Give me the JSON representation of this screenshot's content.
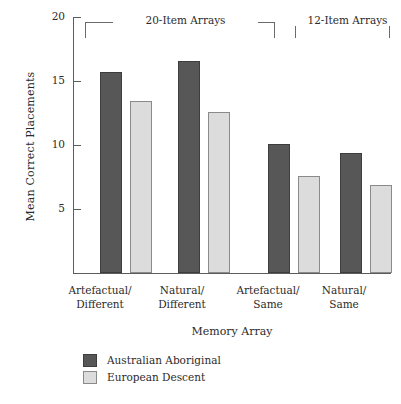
{
  "chart_data": {
    "type": "bar",
    "title": "",
    "xlabel": "Memory Array",
    "ylabel": "Mean Correct Placements",
    "categories": [
      "Artefactual/ Different",
      "Natural/ Different",
      "Artefactual/ Same",
      "Natural/ Same"
    ],
    "category_lines": [
      [
        "Artefactual/",
        "Different"
      ],
      [
        "Natural/",
        "Different"
      ],
      [
        "Artefactual/",
        "Same"
      ],
      [
        "Natural/",
        "Same"
      ]
    ],
    "series": [
      {
        "name": "Australian Aboriginal",
        "values": [
          15.7,
          16.6,
          10.1,
          9.4
        ],
        "color": "#575757"
      },
      {
        "name": "European Descent",
        "values": [
          13.4,
          12.6,
          7.6,
          6.9
        ],
        "color": "#dcdcdc"
      }
    ],
    "ylim": [
      0,
      20
    ],
    "yticks": [
      5,
      10,
      15,
      20
    ],
    "ytick_labels": [
      "5",
      "10",
      "15",
      "20"
    ],
    "grid": false,
    "legend_position": "below-bottom-left",
    "annotations": [
      {
        "label": "20-Item Arrays",
        "spans_categories": [
          0,
          1
        ]
      },
      {
        "label": "12-Item Arrays",
        "spans_categories": [
          2,
          3
        ]
      }
    ]
  },
  "axis": {
    "y_title": "Mean Correct Placements",
    "x_title": "Memory Array",
    "ticks": [
      {
        "value": "20",
        "top": 17
      },
      {
        "value": "15",
        "top": 81
      },
      {
        "value": "10",
        "top": 145
      },
      {
        "value": "5",
        "top": 209
      }
    ]
  },
  "brackets": [
    {
      "label": "20-Item Arrays",
      "left": 12,
      "width": 190,
      "label_left": 40,
      "label_width": 135
    },
    {
      "label": "12-Item Arrays",
      "left": 222,
      "width": 95,
      "label_left": 222,
      "label_width": 95
    }
  ],
  "groups": [
    {
      "label_line1": "Artefactual/",
      "label_line2": "Different",
      "label_left": 74,
      "bars": [
        {
          "series": "Australian Aboriginal",
          "value": 15.7,
          "left": 26,
          "style": "dark"
        },
        {
          "series": "European Descent",
          "value": 13.4,
          "left": 56,
          "style": "light"
        }
      ]
    },
    {
      "label_line1": "Natural/",
      "label_line2": "Different",
      "label_left": 156,
      "bars": [
        {
          "series": "Australian Aboriginal",
          "value": 16.6,
          "left": 104,
          "style": "dark"
        },
        {
          "series": "European Descent",
          "value": 12.6,
          "left": 134,
          "style": "light"
        }
      ]
    },
    {
      "label_line1": "Artefactual/",
      "label_line2": "Same",
      "label_left": 242,
      "bars": [
        {
          "series": "Australian Aboriginal",
          "value": 10.1,
          "left": 194,
          "style": "dark"
        },
        {
          "series": "European Descent",
          "value": 7.6,
          "left": 224,
          "style": "light"
        }
      ]
    },
    {
      "label_line1": "Natural/",
      "label_line2": "Same",
      "label_left": 318,
      "bars": [
        {
          "series": "Australian Aboriginal",
          "value": 9.4,
          "left": 266,
          "style": "dark"
        },
        {
          "series": "European Descent",
          "value": 6.9,
          "left": 296,
          "style": "light"
        }
      ]
    }
  ],
  "legend": {
    "items": [
      {
        "label": "Australian Aboriginal",
        "style": "dark"
      },
      {
        "label": "European Descent",
        "style": "light"
      }
    ]
  }
}
